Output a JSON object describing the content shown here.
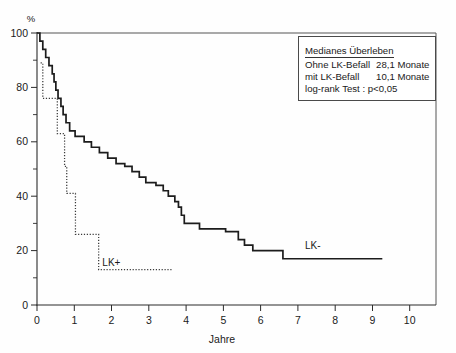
{
  "chart_data": {
    "type": "line",
    "title": "",
    "xlabel": "Jahre",
    "ylabel": "%",
    "xlim": [
      0,
      11.0
    ],
    "ylim": [
      0,
      100
    ],
    "grid": false,
    "legend_position": "top-right",
    "xticks": [
      "0",
      "1",
      "2",
      "3",
      "4",
      "5",
      "6",
      "7",
      "8",
      "9",
      "10"
    ],
    "yticks": [
      "0",
      "20",
      "40",
      "60",
      "80",
      "100"
    ],
    "y_minor_ticks": [
      10,
      30,
      50,
      70,
      90
    ],
    "series": [
      {
        "name": "LK-",
        "style": "solid",
        "label_text": "LK-",
        "label_x": 7.6,
        "label_y": 20.5,
        "points": [
          [
            0.0,
            100
          ],
          [
            0.08,
            100
          ],
          [
            0.08,
            97
          ],
          [
            0.16,
            97
          ],
          [
            0.16,
            94
          ],
          [
            0.24,
            94
          ],
          [
            0.24,
            91
          ],
          [
            0.33,
            91
          ],
          [
            0.33,
            88
          ],
          [
            0.42,
            88
          ],
          [
            0.42,
            85
          ],
          [
            0.47,
            85
          ],
          [
            0.47,
            82
          ],
          [
            0.52,
            82
          ],
          [
            0.52,
            79
          ],
          [
            0.58,
            79
          ],
          [
            0.58,
            76
          ],
          [
            0.66,
            76
          ],
          [
            0.66,
            73
          ],
          [
            0.72,
            73
          ],
          [
            0.72,
            70
          ],
          [
            0.8,
            70
          ],
          [
            0.8,
            67
          ],
          [
            0.9,
            67
          ],
          [
            0.9,
            64
          ],
          [
            1.05,
            64
          ],
          [
            1.05,
            62
          ],
          [
            1.3,
            62
          ],
          [
            1.3,
            60
          ],
          [
            1.5,
            60
          ],
          [
            1.5,
            58
          ],
          [
            1.72,
            58
          ],
          [
            1.72,
            56
          ],
          [
            1.95,
            56
          ],
          [
            1.95,
            54
          ],
          [
            2.18,
            54
          ],
          [
            2.18,
            52
          ],
          [
            2.42,
            52
          ],
          [
            2.42,
            51
          ],
          [
            2.62,
            51
          ],
          [
            2.62,
            49
          ],
          [
            2.82,
            49
          ],
          [
            2.82,
            47
          ],
          [
            3.0,
            47
          ],
          [
            3.0,
            45
          ],
          [
            3.28,
            45
          ],
          [
            3.28,
            44
          ],
          [
            3.48,
            44
          ],
          [
            3.48,
            42
          ],
          [
            3.62,
            42
          ],
          [
            3.62,
            40
          ],
          [
            3.8,
            40
          ],
          [
            3.8,
            38
          ],
          [
            3.9,
            38
          ],
          [
            3.9,
            36
          ],
          [
            3.98,
            36
          ],
          [
            3.98,
            33
          ],
          [
            4.06,
            33
          ],
          [
            4.06,
            30
          ],
          [
            4.48,
            30
          ],
          [
            4.48,
            28
          ],
          [
            5.2,
            28
          ],
          [
            5.2,
            27
          ],
          [
            5.55,
            27
          ],
          [
            5.55,
            24
          ],
          [
            5.72,
            24
          ],
          [
            5.72,
            22
          ],
          [
            5.95,
            22
          ],
          [
            5.95,
            20
          ],
          [
            6.78,
            20
          ],
          [
            6.78,
            17
          ],
          [
            9.52,
            17
          ]
        ]
      },
      {
        "name": "LK+",
        "style": "dotted",
        "label_text": "LK+",
        "label_x": 2.05,
        "label_y": 14.5,
        "points": [
          [
            0.1,
            89
          ],
          [
            0.16,
            89
          ],
          [
            0.16,
            76
          ],
          [
            0.56,
            76
          ],
          [
            0.56,
            63
          ],
          [
            0.76,
            63
          ],
          [
            0.76,
            51
          ],
          [
            0.82,
            51
          ],
          [
            0.82,
            41
          ],
          [
            1.06,
            41
          ],
          [
            1.06,
            26
          ],
          [
            1.7,
            26
          ],
          [
            1.7,
            13
          ],
          [
            3.75,
            13
          ]
        ]
      }
    ],
    "annotation_box": {
      "title": "Medianes Überleben",
      "rows": [
        {
          "label": "Ohne LK-Befall",
          "value": "28,1 Monate"
        },
        {
          "label": "mit LK-Befall",
          "value": "10,1 Monate"
        }
      ],
      "footer": "log-rank Test : p<0,05"
    }
  }
}
